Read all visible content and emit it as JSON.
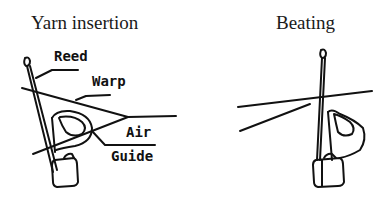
{
  "figure": {
    "left_panel": {
      "title": "Yarn insertion",
      "labels": {
        "reed": "Reed",
        "warp": "Warp",
        "air": "Air",
        "guide": "Guide"
      }
    },
    "right_panel": {
      "title": "Beating"
    }
  },
  "colors": {
    "ink": "#111111",
    "background": "#ffffff"
  }
}
